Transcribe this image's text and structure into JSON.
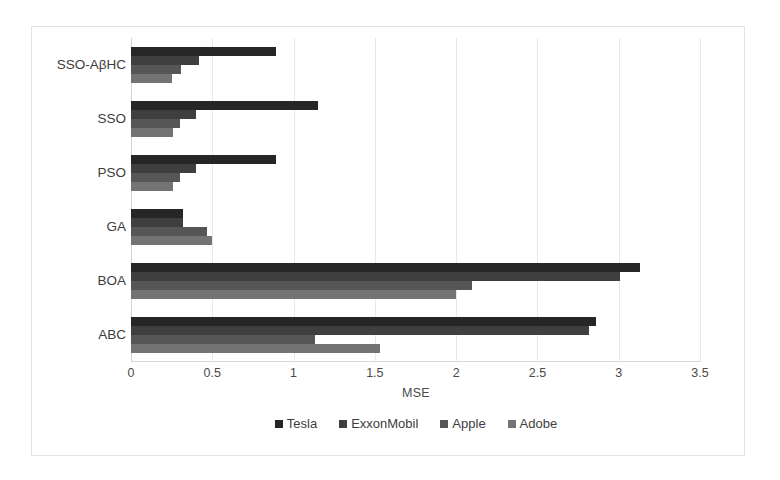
{
  "chart_data": {
    "type": "bar",
    "orientation": "horizontal",
    "title": "",
    "xlabel": "MSE",
    "ylabel": "",
    "xlim": [
      0,
      3.5
    ],
    "xticks": [
      "0",
      "0.5",
      "1",
      "1.5",
      "2",
      "2.5",
      "3",
      "3.5"
    ],
    "xtick_values": [
      0,
      0.5,
      1,
      1.5,
      2,
      2.5,
      3,
      3.5
    ],
    "grid": true,
    "grid_axis": "x",
    "legend_position": "bottom",
    "categories": [
      "SSO-AβHC",
      "SSO",
      "PSO",
      "GA",
      "BOA",
      "ABC"
    ],
    "series": [
      {
        "name": "Tesla",
        "color": "#262626",
        "values": [
          0.89,
          1.15,
          0.89,
          0.32,
          3.13,
          2.86
        ]
      },
      {
        "name": "ExxonMobil",
        "color": "#3f3f3f",
        "values": [
          0.42,
          0.4,
          0.4,
          0.32,
          3.01,
          2.82
        ]
      },
      {
        "name": "Apple",
        "color": "#565656",
        "values": [
          0.31,
          0.3,
          0.3,
          0.47,
          2.1,
          1.13
        ]
      },
      {
        "name": "Adobe",
        "color": "#737373",
        "values": [
          0.25,
          0.26,
          0.26,
          0.5,
          2.0,
          1.53
        ]
      }
    ]
  },
  "legend": {
    "items": [
      {
        "label": "Tesla",
        "color": "#262626"
      },
      {
        "label": "ExxonMobil",
        "color": "#3f3f3f"
      },
      {
        "label": "Apple",
        "color": "#565656"
      },
      {
        "label": "Adobe",
        "color": "#737373"
      }
    ]
  },
  "axes": {
    "x_title": "MSE",
    "x_tick_labels": [
      "0",
      "0.5",
      "1",
      "1.5",
      "2",
      "2.5",
      "3",
      "3.5"
    ],
    "y_tick_labels": [
      "SSO-AβHC",
      "SSO",
      "PSO",
      "GA",
      "BOA",
      "ABC"
    ]
  },
  "colors": {
    "background": "#ffffff",
    "frame": "#e3e3e3",
    "gridline": "#e8e8e8",
    "axis": "#d9d9d9",
    "text": "#3d3d3d"
  }
}
